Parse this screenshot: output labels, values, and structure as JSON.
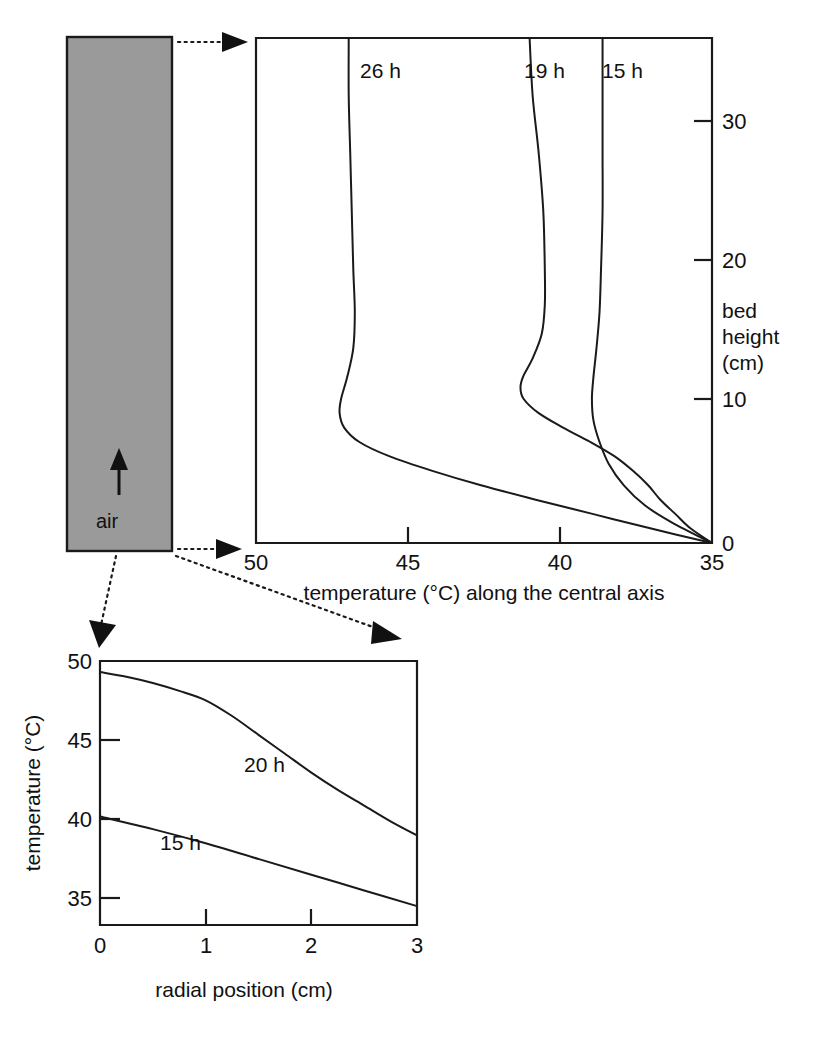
{
  "figure": {
    "background_color": "#ffffff",
    "line_color": "#1a1a1a",
    "bed_fill_color": "#9a9a9a"
  },
  "bed_column": {
    "name": "packed bed column",
    "air_label": "air",
    "air_flow_direction": "upward",
    "fill_color": "#9a9a9a",
    "border_color": "#1a1a1a"
  },
  "connectors": [
    {
      "name": "bed-top-to-axial-chart",
      "from": "column top",
      "to": "axial chart top"
    },
    {
      "name": "bed-bottom-to-axial-chart",
      "from": "column bottom",
      "to": "axial chart bottom"
    },
    {
      "name": "bed-bottom-left-to-radial-chart",
      "from": "column bottom left",
      "to": "radial chart left"
    },
    {
      "name": "bed-bottom-right-to-radial-chart",
      "from": "column bottom right",
      "to": "radial chart right"
    }
  ],
  "chart_data": [
    {
      "id": "axial-profile",
      "type": "line",
      "title": "",
      "xlabel": "temperature (°C) along the central axis",
      "ylabel": "bed height (cm)",
      "ylabel_lines": [
        "bed",
        "height",
        "(cm)"
      ],
      "xticks": [
        50,
        45,
        40,
        35
      ],
      "xticklabels": [
        "50",
        "45",
        "40",
        "35"
      ],
      "yticks": [
        0,
        10,
        20,
        30
      ],
      "yticklabels": [
        "0",
        "10",
        "20",
        "30"
      ],
      "xlim": [
        50,
        35
      ],
      "ylim": [
        0,
        35
      ],
      "x_axis_reversed": true,
      "y_axis_position": "right",
      "grid": false,
      "legend": "inline curve labels",
      "series": [
        {
          "name": "26 h",
          "label": "26 h",
          "points": [
            [
              46.95,
              35.0
            ],
            [
              46.95,
              31.0
            ],
            [
              46.9,
              27.0
            ],
            [
              46.85,
              23.0
            ],
            [
              46.8,
              19.0
            ],
            [
              46.75,
              16.0
            ],
            [
              46.8,
              13.5
            ],
            [
              47.0,
              11.5
            ],
            [
              47.2,
              10.0
            ],
            [
              47.25,
              9.0
            ],
            [
              47.1,
              8.0
            ],
            [
              46.6,
              7.0
            ],
            [
              45.6,
              6.0
            ],
            [
              44.2,
              5.0
            ],
            [
              42.6,
              4.0
            ],
            [
              40.8,
              3.0
            ],
            [
              38.9,
              2.0
            ],
            [
              37.0,
              1.0
            ],
            [
              35.0,
              0.0
            ]
          ]
        },
        {
          "name": "19 h",
          "label": "19 h",
          "points": [
            [
              41.0,
              35.0
            ],
            [
              40.9,
              31.0
            ],
            [
              40.7,
              27.0
            ],
            [
              40.55,
              23.0
            ],
            [
              40.5,
              19.0
            ],
            [
              40.5,
              16.5
            ],
            [
              40.6,
              14.5
            ],
            [
              40.9,
              12.8
            ],
            [
              41.2,
              11.6
            ],
            [
              41.3,
              10.8
            ],
            [
              41.2,
              10.0
            ],
            [
              40.7,
              9.0
            ],
            [
              39.9,
              8.0
            ],
            [
              39.0,
              7.0
            ],
            [
              38.2,
              6.0
            ],
            [
              37.6,
              5.0
            ],
            [
              37.1,
              4.0
            ],
            [
              36.7,
              3.0
            ],
            [
              36.2,
              2.0
            ],
            [
              35.7,
              1.0
            ],
            [
              35.0,
              0.0
            ]
          ]
        },
        {
          "name": "15 h",
          "label": "15 h",
          "points": [
            [
              38.6,
              35.0
            ],
            [
              38.6,
              31.0
            ],
            [
              38.6,
              27.0
            ],
            [
              38.6,
              23.0
            ],
            [
              38.65,
              19.0
            ],
            [
              38.7,
              16.0
            ],
            [
              38.8,
              13.5
            ],
            [
              38.9,
              11.5
            ],
            [
              38.95,
              10.0
            ],
            [
              38.9,
              8.5
            ],
            [
              38.7,
              7.0
            ],
            [
              38.4,
              5.5
            ],
            [
              37.9,
              4.0
            ],
            [
              37.2,
              2.6
            ],
            [
              36.3,
              1.4
            ],
            [
              35.0,
              0.0
            ]
          ]
        }
      ]
    },
    {
      "id": "radial-profile",
      "type": "line",
      "title": "",
      "xlabel": "radial position (cm)",
      "ylabel": "temperature (°C)",
      "xticks": [
        0,
        1,
        2,
        3
      ],
      "xticklabels": [
        "0",
        "1",
        "2",
        "3"
      ],
      "yticks": [
        35,
        40,
        45,
        50
      ],
      "yticklabels": [
        "35",
        "40",
        "45",
        "50"
      ],
      "xlim": [
        0,
        3
      ],
      "ylim": [
        33.2,
        50
      ],
      "grid": false,
      "legend": "inline curve labels",
      "series": [
        {
          "name": "20 h",
          "label": "20 h",
          "points": [
            [
              0.0,
              49.3
            ],
            [
              0.25,
              49.0
            ],
            [
              0.5,
              48.6
            ],
            [
              0.75,
              48.1
            ],
            [
              1.0,
              47.5
            ],
            [
              1.25,
              46.5
            ],
            [
              1.5,
              45.3
            ],
            [
              1.75,
              44.1
            ],
            [
              2.0,
              42.9
            ],
            [
              2.25,
              41.8
            ],
            [
              2.5,
              40.8
            ],
            [
              2.75,
              39.8
            ],
            [
              3.0,
              38.9
            ]
          ]
        },
        {
          "name": "15 h",
          "label": "15 h",
          "points": [
            [
              0.0,
              40.1
            ],
            [
              0.5,
              39.3
            ],
            [
              1.0,
              38.4
            ],
            [
              1.5,
              37.4
            ],
            [
              2.0,
              36.4
            ],
            [
              2.5,
              35.4
            ],
            [
              3.0,
              34.4
            ]
          ]
        }
      ]
    }
  ]
}
